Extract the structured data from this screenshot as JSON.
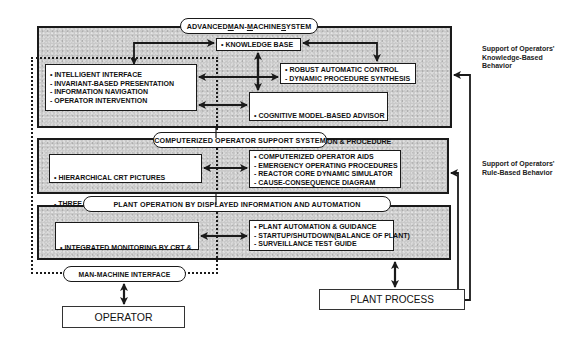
{
  "layers": {
    "advanced_mms": {
      "title_parts": [
        {
          "u": "",
          "t": "ADVANCED "
        },
        {
          "u": "M",
          "t": "AN-"
        },
        {
          "u": "M",
          "t": "ACHINE "
        },
        {
          "u": "S",
          "t": "YSTEM"
        }
      ],
      "title": "ADVANCED MAN-MACHINE SYSTEM",
      "knowledge_base": "• KNOWLEDGE BASE",
      "interface_items": [
        "• INTELLIGENT INTERFACE",
        "- INVARIANT-BASED PRESENTATION",
        "- INFORMATION NAVIGATION",
        "- OPERATOR INTERVENTION"
      ],
      "control_items": [
        "• ROBUST AUTOMATIC CONTROL",
        "- DYNAMIC PROCEDURE SYNTHESIS"
      ],
      "advisor_items": [
        "• COGNITIVE MODEL-BASED ADVISOR",
        "- STATE IDENTIFICATION & PROCEDURE",
        "  SYNTHESIS"
      ]
    },
    "coss": {
      "title": "COMPUTERIZED OPERATOR SUPPORT SYSTEM",
      "display_items": [
        "• HIERARCHICAL CRT PICTURES",
        "- THREE LEVELS INCLUDING",
        "  LARGE OVERVIEW DISPLAY"
      ],
      "aids_items": [
        "• COMPUTERIZED OPERATOR AIDS",
        "- EMERGENCY OPERATING PROCEDURES",
        "- REACTOR CORE DYNAMIC SIMULATOR",
        "- CAUSE-CONSEQUENCE DIAGRAM"
      ]
    },
    "plant_operation": {
      "title": "PLANT OPERATION BY DISPLAYED INFORMATION AND AUTOMATION",
      "monitoring_items": [
        "• INTEGRATED MONITORING BY CRT &",
        "  CONVENTIONAL CONTROL"
      ],
      "automation_items": [
        "• PLANT AUTOMATION & GUIDANCE",
        "- STARTUP/SHUTDOWN(BALANCE OF PLANT)",
        "- SURVEILLANCE TEST GUIDE"
      ]
    }
  },
  "mmi_label": "MAN-MACHINE INTERFACE",
  "operator_label": "OPERATOR",
  "plant_process_label": "PLANT PROCESS",
  "notes": {
    "knowledge_based": [
      "Support of Operators'",
      "Knowledge-Based",
      "Behavior"
    ],
    "rule_based": [
      "Support of Operators'",
      "Rule-Based Behavior"
    ]
  },
  "colors": {
    "layer_fill": "#c9c9c9",
    "line": "#1a1a1a",
    "box_fill": "#ffffff"
  }
}
